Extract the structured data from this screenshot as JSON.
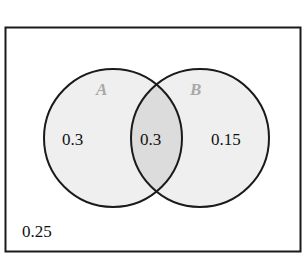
{
  "diagram": {
    "type": "venn",
    "sets": [
      {
        "name": "A",
        "label": "A",
        "only_value": "0.3"
      },
      {
        "name": "B",
        "label": "B",
        "only_value": "0.15"
      }
    ],
    "intersection_value": "0.3",
    "outside_value": "0.25",
    "colors": {
      "border": "#1a1a1a",
      "circle_fill": "#efefef",
      "intersection_fill": "#dcdcdc",
      "set_label": "#a8a8a8",
      "background": "#ffffff"
    }
  }
}
